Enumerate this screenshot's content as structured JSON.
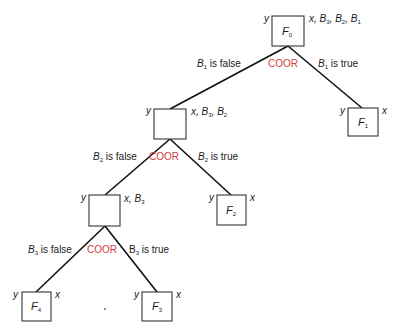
{
  "diagram": {
    "type": "decision-tree",
    "colors": {
      "coor": "#d04040",
      "line": "#111111",
      "box": "#333333"
    },
    "nodes": [
      {
        "id": "F0",
        "label": "F",
        "sub": "0",
        "left": "y",
        "right": "x, B3, B2, B1"
      },
      {
        "id": "n2",
        "label": "",
        "sub": "",
        "left": "y",
        "right": "x, B3, B2"
      },
      {
        "id": "F1",
        "label": "F",
        "sub": "1",
        "left": "y",
        "right": "x"
      },
      {
        "id": "n3",
        "label": "",
        "sub": "",
        "left": "y",
        "right": "x, B3"
      },
      {
        "id": "F2",
        "label": "F",
        "sub": "2",
        "left": "y",
        "right": "x"
      },
      {
        "id": "F4",
        "label": "F",
        "sub": "4",
        "left": "y",
        "right": "x"
      },
      {
        "id": "F3",
        "label": "F",
        "sub": "3",
        "left": "y",
        "right": "x"
      }
    ],
    "splits": [
      {
        "coor": "COOR",
        "false_var": "B",
        "false_sub": "1",
        "false_text": " is false",
        "true_var": "B",
        "true_sub": "1",
        "true_text": " is true"
      },
      {
        "coor": "COOR",
        "false_var": "B",
        "false_sub": "2",
        "false_text": " is false",
        "true_var": "B",
        "true_sub": "2",
        "true_text": " is true"
      },
      {
        "coor": "COOR",
        "false_var": "B",
        "false_sub": "3",
        "false_text": " is false",
        "true_var": "B",
        "true_sub": "3",
        "true_text": " is true"
      }
    ],
    "annotations": {
      "F0_right": {
        "x": "x",
        "b3": "B",
        "b3s": "3",
        "b2": "B",
        "b2s": "2",
        "b1": "B",
        "b1s": "1"
      },
      "n2_right": {
        "x": "x",
        "b3": "B",
        "b3s": "3",
        "b2": "B",
        "b2s": "2"
      },
      "n3_right": {
        "x": "x",
        "b3": "B",
        "b3s": "3"
      }
    }
  }
}
